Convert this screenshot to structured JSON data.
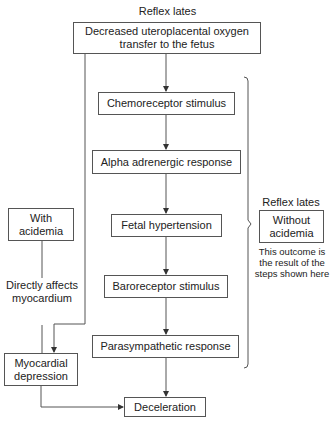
{
  "diagram": {
    "top_label": "Reflex lates",
    "nodes": {
      "start": "Decreased uteroplacental oxygen transfer to the fetus",
      "chemo": "Chemoreceptor stimulus",
      "alpha": "Alpha adrenergic response",
      "fetal_htn": "Fetal hypertension",
      "baro": "Baroreceptor stimulus",
      "parasym": "Parasympathetic response",
      "decel": "Deceleration",
      "with_acidemia": "With acidemia",
      "myocardial": "Myocardial depression",
      "without_acidemia": "Without acidemia"
    },
    "edge_labels": {
      "direct": "Directly affects myocardium"
    },
    "side_label": "Reflex lates",
    "side_caption": "This outcome is the result of the steps shown here",
    "line_color": "#555555"
  }
}
